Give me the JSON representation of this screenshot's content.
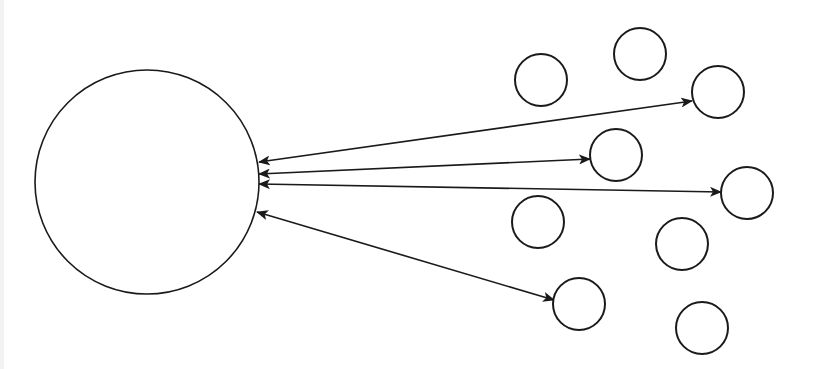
{
  "diagram": {
    "type": "hub-and-nodes",
    "stroke_color": "#1a1a1a",
    "background": "#ffffff",
    "hub": {
      "id": "hub",
      "cx": 147,
      "cy": 182,
      "r": 112
    },
    "nodes": [
      {
        "id": "n1",
        "cx": 541,
        "cy": 80,
        "r": 26,
        "connected": false
      },
      {
        "id": "n2",
        "cx": 640,
        "cy": 54,
        "r": 26,
        "connected": false
      },
      {
        "id": "n3",
        "cx": 718,
        "cy": 92,
        "r": 26,
        "connected": true
      },
      {
        "id": "n4",
        "cx": 616,
        "cy": 155,
        "r": 26,
        "connected": true
      },
      {
        "id": "n5",
        "cx": 747,
        "cy": 193,
        "r": 26,
        "connected": true
      },
      {
        "id": "n6",
        "cx": 538,
        "cy": 222,
        "r": 26,
        "connected": false
      },
      {
        "id": "n7",
        "cx": 682,
        "cy": 244,
        "r": 26,
        "connected": false
      },
      {
        "id": "n8",
        "cx": 579,
        "cy": 304,
        "r": 26,
        "connected": true
      },
      {
        "id": "n9",
        "cx": 702,
        "cy": 328,
        "r": 26,
        "connected": false
      }
    ],
    "edges": [
      {
        "from": "hub",
        "to": "n3",
        "x1": 259,
        "y1": 162,
        "x2": 692,
        "y2": 101,
        "bidirectional": true
      },
      {
        "from": "hub",
        "to": "n4",
        "x1": 259,
        "y1": 174,
        "x2": 590,
        "y2": 159,
        "bidirectional": true
      },
      {
        "from": "hub",
        "to": "n5",
        "x1": 259,
        "y1": 184,
        "x2": 721,
        "y2": 192,
        "bidirectional": true
      },
      {
        "from": "hub",
        "to": "n8",
        "x1": 257,
        "y1": 212,
        "x2": 554,
        "y2": 300,
        "bidirectional": true
      }
    ]
  }
}
